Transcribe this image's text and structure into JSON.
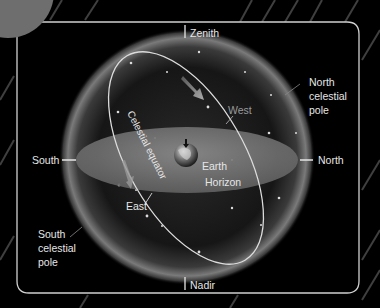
{
  "diagram": {
    "labels": {
      "zenith": "Zenith",
      "nadir": "Nadir",
      "north": "North",
      "south": "South",
      "east": "East",
      "west": "West",
      "earth": "Earth",
      "horizon": "Horizon",
      "celestial_equator": "Celestial equator",
      "north_celestial_pole": [
        "North",
        "celestial",
        "pole"
      ],
      "south_celestial_pole": [
        "South",
        "celestial",
        "pole"
      ]
    },
    "colors": {
      "background": "#000000",
      "frame": "#d0d0d0",
      "label": "#e6e6e6",
      "west_label": "#9a9a9a",
      "horizon_disk": "#7a7a7a",
      "sphere_glow": "#8a8a8a",
      "equator_line": "#dcdcdc",
      "corner_circle": "#6e6e6e"
    }
  }
}
